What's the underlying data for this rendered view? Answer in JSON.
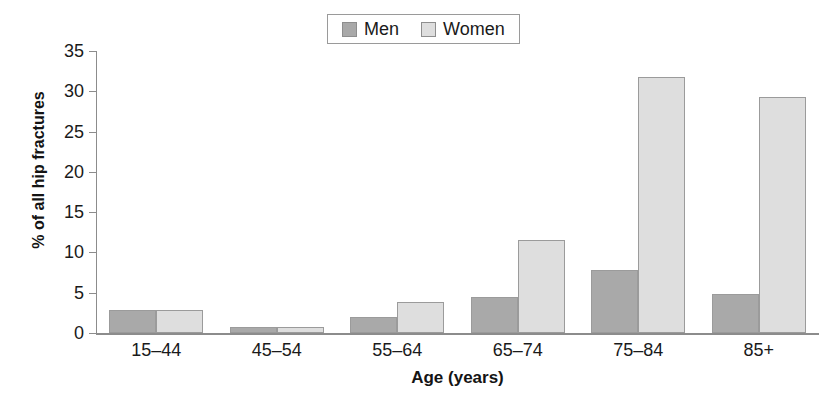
{
  "chart_data": {
    "type": "bar",
    "title": "",
    "xlabel": "Age (years)",
    "ylabel": "% of all hip fractures",
    "categories": [
      "15–44",
      "45–54",
      "55–64",
      "65–74",
      "75–84",
      "85+"
    ],
    "series": [
      {
        "name": "Men",
        "values": [
          2.9,
          0.8,
          2.0,
          4.5,
          7.8,
          4.8
        ],
        "color": "#a9a9a9"
      },
      {
        "name": "Women",
        "values": [
          2.9,
          0.8,
          3.9,
          11.5,
          31.8,
          29.3
        ],
        "color": "#dedede"
      }
    ],
    "ylim": [
      0,
      35
    ],
    "yticks": [
      0,
      5,
      10,
      15,
      20,
      25,
      30,
      35
    ],
    "ytick_labels": [
      "0",
      "5",
      "10",
      "15",
      "20",
      "25",
      "30",
      "35"
    ],
    "grid": false,
    "legend_position": "top-center"
  },
  "legend": {
    "entries": [
      {
        "label": "Men"
      },
      {
        "label": "Women"
      }
    ]
  }
}
